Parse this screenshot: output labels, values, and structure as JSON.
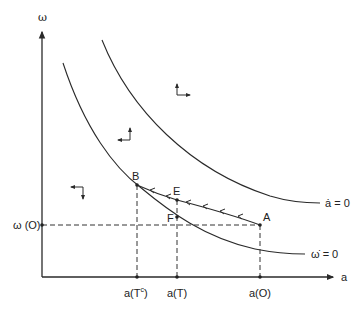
{
  "diagram": {
    "type": "phase-diagram",
    "axes": {
      "x_label": "a",
      "y_label": "ω"
    },
    "curves": [
      {
        "id": "a-dot-zero",
        "label": "ȧ = 0"
      },
      {
        "id": "omega-dot-zero",
        "label": "ω̇ = 0"
      }
    ],
    "points": {
      "A": "A",
      "B": "B",
      "E": "E",
      "F": "F"
    },
    "y_ticks": {
      "omega_O": "ω (O)"
    },
    "x_ticks": {
      "a_Tc": "a(T",
      "a_Tc_sup": "c",
      "a_Tc_close": ")",
      "a_T": "a(T)",
      "a_O": "a(O)"
    },
    "direction_arrows": [
      {
        "region": "upper-right",
        "directions": [
          "up",
          "right"
        ]
      },
      {
        "region": "middle",
        "directions": [
          "up",
          "left"
        ]
      },
      {
        "region": "lower-left",
        "directions": [
          "down",
          "left"
        ]
      }
    ],
    "trajectory": {
      "from": "A",
      "to": "B",
      "via": "E",
      "arrow_count": 6
    }
  }
}
